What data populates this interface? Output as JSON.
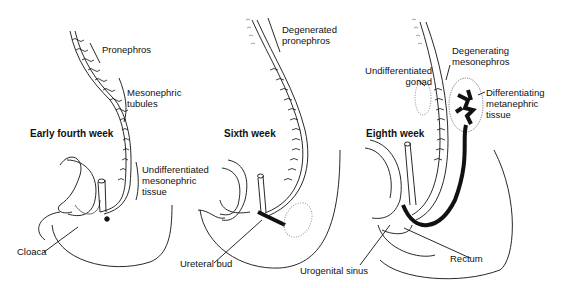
{
  "figure": {
    "panels": [
      {
        "id": "early-fourth-week",
        "title": "Early fourth week",
        "labels": {
          "pronephros": "Pronephros",
          "mesonephric_tubules_1": "Mesonephric",
          "mesonephric_tubules_2": "tubules",
          "undiff_1": "Undifferentiated",
          "undiff_2": "mesonephric",
          "undiff_3": "tissue",
          "cloaca": "Cloaca"
        }
      },
      {
        "id": "sixth-week",
        "title": "Sixth week",
        "labels": {
          "degenerated_1": "Degenerated",
          "degenerated_2": "pronephros",
          "ureteral_bud": "Ureteral bud",
          "urogenital_sinus": "Urogenital sinus"
        }
      },
      {
        "id": "eighth-week",
        "title": "Eighth week",
        "labels": {
          "gonad_1": "Undifferentiated",
          "gonad_2": "gonad",
          "degenerating_1": "Degenerating",
          "degenerating_2": "mesonephros",
          "metanephric_1": "Differentiating",
          "metanephric_2": "metanephric",
          "metanephric_3": "tissue",
          "rectum": "Rectum"
        }
      }
    ],
    "colors": {
      "ink": "#111111",
      "background": "#ffffff",
      "stipple": "#888888"
    }
  }
}
